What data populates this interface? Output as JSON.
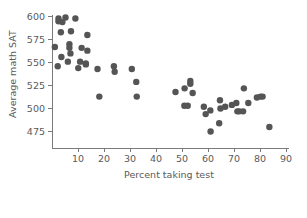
{
  "chart_data": {
    "type": "scatter",
    "title": "",
    "xlabel": "Percent taking test",
    "ylabel": "Average math SAT",
    "xlim": [
      0,
      90
    ],
    "ylim": [
      468,
      605
    ],
    "xticks": [
      10,
      20,
      30,
      40,
      50,
      60,
      70,
      80,
      90
    ],
    "xticklabels": [
      "10",
      "20",
      "30",
      "40",
      "50",
      "60",
      "70",
      "80",
      "90"
    ],
    "yticks": [
      475,
      500,
      525,
      550,
      575,
      600
    ],
    "yticklabels": [
      "475",
      "500",
      "525",
      "550",
      "575",
      "600"
    ],
    "grid": false,
    "legend": null,
    "marker": {
      "shape": "circle",
      "color": "#555555",
      "size": 3.2
    },
    "points": [
      {
        "x": 2.5,
        "y": 598
      },
      {
        "x": 2.5,
        "y": 595
      },
      {
        "x": 5.2,
        "y": 599
      },
      {
        "x": 4.0,
        "y": 594
      },
      {
        "x": 9.0,
        "y": 598
      },
      {
        "x": 3.4,
        "y": 583
      },
      {
        "x": 7.3,
        "y": 584
      },
      {
        "x": 13.6,
        "y": 580
      },
      {
        "x": 1.1,
        "y": 567
      },
      {
        "x": 6.7,
        "y": 570
      },
      {
        "x": 6.7,
        "y": 566
      },
      {
        "x": 11.4,
        "y": 566
      },
      {
        "x": 13.6,
        "y": 563
      },
      {
        "x": 7.1,
        "y": 560
      },
      {
        "x": 3.6,
        "y": 556
      },
      {
        "x": 6.1,
        "y": 551
      },
      {
        "x": 10.8,
        "y": 551
      },
      {
        "x": 13.0,
        "y": 549
      },
      {
        "x": 13.0,
        "y": 548
      },
      {
        "x": 2.2,
        "y": 546
      },
      {
        "x": 10.1,
        "y": 544
      },
      {
        "x": 17.5,
        "y": 543
      },
      {
        "x": 23.8,
        "y": 546
      },
      {
        "x": 24.1,
        "y": 540
      },
      {
        "x": 30.7,
        "y": 543
      },
      {
        "x": 32.4,
        "y": 529
      },
      {
        "x": 18.2,
        "y": 513
      },
      {
        "x": 32.6,
        "y": 513
      },
      {
        "x": 47.5,
        "y": 518
      },
      {
        "x": 53.2,
        "y": 530
      },
      {
        "x": 53.2,
        "y": 527
      },
      {
        "x": 51.0,
        "y": 522
      },
      {
        "x": 54.1,
        "y": 517
      },
      {
        "x": 50.9,
        "y": 503
      },
      {
        "x": 52.2,
        "y": 503
      },
      {
        "x": 58.4,
        "y": 502
      },
      {
        "x": 59.1,
        "y": 494
      },
      {
        "x": 61.0,
        "y": 475
      },
      {
        "x": 64.3,
        "y": 484
      },
      {
        "x": 64.6,
        "y": 509
      },
      {
        "x": 64.8,
        "y": 500
      },
      {
        "x": 66.6,
        "y": 502
      },
      {
        "x": 69.2,
        "y": 504
      },
      {
        "x": 70.9,
        "y": 506
      },
      {
        "x": 71.3,
        "y": 497
      },
      {
        "x": 72.0,
        "y": 497
      },
      {
        "x": 73.5,
        "y": 497
      },
      {
        "x": 73.8,
        "y": 522
      },
      {
        "x": 75.5,
        "y": 506
      },
      {
        "x": 78.8,
        "y": 512
      },
      {
        "x": 80.2,
        "y": 513
      },
      {
        "x": 81.0,
        "y": 513
      },
      {
        "x": 83.6,
        "y": 480
      },
      {
        "x": 60.9,
        "y": 498
      }
    ]
  }
}
